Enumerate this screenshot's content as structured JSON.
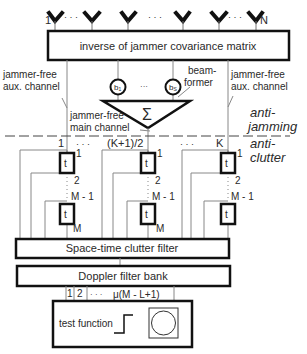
{
  "antennas": {
    "first_label": "1",
    "last_label": "N",
    "dots": "· · ·"
  },
  "matrix_box": {
    "label": "inverse of jammer covariance matrix"
  },
  "aux_left": {
    "line1": "jammer-free",
    "line2": "aux. channel"
  },
  "aux_right": {
    "line1": "jammer-free",
    "line2": "aux. channel"
  },
  "beamformer": {
    "label_line1": "beam-",
    "label_line2": "former",
    "weight_first": "b",
    "weight_first_sub": "1",
    "weight_last": "b",
    "weight_last_sub": "S",
    "weight_sup": "*",
    "dots": "···",
    "sum_symbol": "Σ"
  },
  "main_channel": {
    "line1": "jammer-free",
    "line2": "main channel"
  },
  "stage_labels": {
    "anti_jamming_1": "anti-",
    "anti_jamming_2": "jamming",
    "anti_clutter_1": "anti-",
    "anti_clutter_2": "clutter"
  },
  "channels": {
    "first": "1",
    "middle": "(K+1)/2",
    "last": "K",
    "dots": "· · ·"
  },
  "taps": {
    "delay_symbol": "t",
    "tap1": "1",
    "tap2": "2",
    "tap_m1": "M - 1",
    "tap_m": "M"
  },
  "clutter_filter": {
    "label": "Space-time clutter filter"
  },
  "doppler_bank": {
    "label": "Doppler filter bank",
    "out1": "1",
    "out2": "2",
    "dots": "· · ·",
    "out_last": "μ(M - L+1)"
  },
  "test_box": {
    "label": "test function"
  }
}
